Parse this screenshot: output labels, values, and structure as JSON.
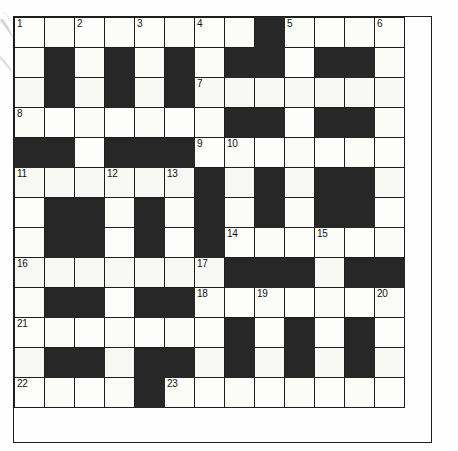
{
  "puzzle": {
    "title": "Crossword Grid",
    "columns": 13,
    "rows": 13,
    "cell_size_px": 32,
    "colors": {
      "block": "#272727",
      "cell": "#fdfdfb",
      "grid_line": "#1d1d1d",
      "number_text": "#121212",
      "page_background": "#ffffff"
    },
    "clue_numbers_visible": [
      1,
      2,
      3,
      4,
      5,
      6,
      7,
      8,
      9,
      10,
      11,
      12,
      13,
      14,
      15,
      16,
      17,
      18,
      19,
      20,
      21,
      22,
      23
    ],
    "legend": {
      "W": "white / fillable cell",
      "B": "black / blocked cell"
    },
    "grid": [
      [
        "W",
        "W",
        "W",
        "W",
        "W",
        "W",
        "W",
        "W",
        "B",
        "W",
        "W",
        "W",
        "W"
      ],
      [
        "W",
        "B",
        "W",
        "B",
        "W",
        "B",
        "W",
        "B",
        "B",
        "W",
        "B",
        "B",
        "W"
      ],
      [
        "W",
        "B",
        "W",
        "B",
        "W",
        "B",
        "W",
        "W",
        "W",
        "W",
        "W",
        "W",
        "W"
      ],
      [
        "W",
        "W",
        "W",
        "W",
        "W",
        "W",
        "W",
        "B",
        "B",
        "W",
        "B",
        "B",
        "W"
      ],
      [
        "B",
        "B",
        "W",
        "B",
        "B",
        "B",
        "W",
        "W",
        "W",
        "W",
        "W",
        "W",
        "W"
      ],
      [
        "W",
        "W",
        "W",
        "W",
        "W",
        "W",
        "B",
        "W",
        "B",
        "W",
        "B",
        "B",
        "W"
      ],
      [
        "W",
        "B",
        "B",
        "W",
        "B",
        "W",
        "B",
        "W",
        "B",
        "W",
        "B",
        "B",
        "W"
      ],
      [
        "W",
        "B",
        "B",
        "W",
        "B",
        "W",
        "B",
        "W",
        "W",
        "W",
        "W",
        "W",
        "W"
      ],
      [
        "W",
        "W",
        "W",
        "W",
        "W",
        "W",
        "W",
        "B",
        "B",
        "B",
        "W",
        "B",
        "B"
      ],
      [
        "W",
        "B",
        "B",
        "W",
        "B",
        "B",
        "W",
        "W",
        "W",
        "W",
        "W",
        "W",
        "W"
      ],
      [
        "W",
        "W",
        "W",
        "W",
        "W",
        "W",
        "W",
        "B",
        "W",
        "B",
        "W",
        "B",
        "W"
      ],
      [
        "W",
        "B",
        "B",
        "W",
        "B",
        "B",
        "W",
        "B",
        "W",
        "B",
        "W",
        "B",
        "W"
      ],
      [
        "W",
        "W",
        "W",
        "W",
        "B",
        "W",
        "W",
        "W",
        "W",
        "W",
        "W",
        "W",
        "W"
      ]
    ],
    "numbers": [
      [
        1,
        "",
        2,
        "",
        3,
        "",
        4,
        "",
        "",
        5,
        "",
        "",
        6
      ],
      [
        "",
        "",
        "",
        "",
        "",
        "",
        "",
        "",
        "",
        "",
        "",
        "",
        ""
      ],
      [
        "",
        "",
        "",
        "",
        "",
        "",
        7,
        "",
        "",
        "",
        "",
        "",
        ""
      ],
      [
        8,
        "",
        "",
        "",
        "",
        "",
        "",
        "",
        "",
        "",
        "",
        "",
        ""
      ],
      [
        "",
        "",
        "",
        "",
        "",
        "",
        9,
        10,
        "",
        "",
        "",
        "",
        ""
      ],
      [
        11,
        "",
        "",
        12,
        "",
        13,
        "",
        "",
        "",
        "",
        "",
        "",
        ""
      ],
      [
        "",
        "",
        "",
        "",
        "",
        "",
        "",
        "",
        "",
        "",
        "",
        "",
        ""
      ],
      [
        "",
        "",
        "",
        "",
        "",
        "",
        "",
        14,
        "",
        "",
        15,
        "",
        ""
      ],
      [
        16,
        "",
        "",
        "",
        "",
        "",
        17,
        "",
        "",
        "",
        "",
        "",
        ""
      ],
      [
        "",
        "",
        "",
        "",
        "",
        "",
        18,
        "",
        19,
        "",
        "",
        "",
        20
      ],
      [
        21,
        "",
        "",
        "",
        "",
        "",
        "",
        "",
        "",
        "",
        "",
        "",
        ""
      ],
      [
        "",
        "",
        "",
        "",
        "",
        "",
        "",
        "",
        "",
        "",
        "",
        "",
        ""
      ],
      [
        22,
        "",
        "",
        "",
        "",
        23,
        "",
        "",
        "",
        "",
        "",
        "",
        ""
      ]
    ]
  }
}
